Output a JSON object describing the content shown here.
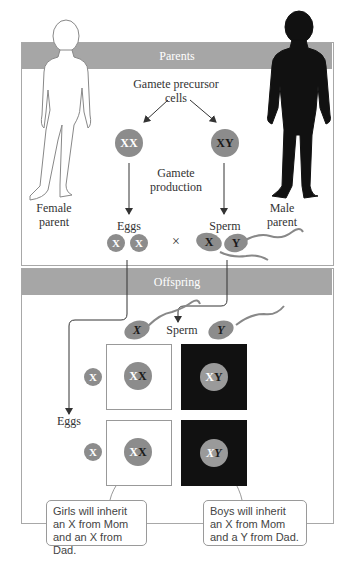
{
  "parents": {
    "band_label": "Parents",
    "precursor_label_line1": "Gamete precursor",
    "precursor_label_line2": "cells",
    "female_cell": "XX",
    "male_cell": "XY",
    "gamete_production_line1": "Gamete",
    "gamete_production_line2": "production",
    "female_parent_line1": "Female",
    "female_parent_line2": "parent",
    "male_parent_line1": "Male",
    "male_parent_line2": "parent",
    "eggs_label": "Eggs",
    "sperm_label": "Sperm",
    "egg_1": "X",
    "egg_2": "X",
    "cross_symbol": "×",
    "sperm_x": "X",
    "sperm_y": "Y"
  },
  "offspring": {
    "band_label": "Offspring",
    "sperm_label": "Sperm",
    "eggs_label": "Eggs",
    "sperm_x": "X",
    "sperm_y": "Y",
    "egg_row_1": "X",
    "egg_row_2": "X",
    "grid": [
      {
        "mother": "X",
        "father": "X"
      },
      {
        "mother": "X",
        "father": "Y"
      },
      {
        "mother": "X",
        "father": "X"
      },
      {
        "mother": "X",
        "father": "Y"
      }
    ],
    "girls_callout": "Girls will inherit an X from Mom and an X from Dad.",
    "boys_callout": "Boys will inherit an X from Mom and a Y from Dad."
  },
  "colors": {
    "band": "#a6a6a6",
    "chromosome_circle": "#8c8c8c",
    "male_square": "#111111",
    "female_square": "#ffffff"
  }
}
